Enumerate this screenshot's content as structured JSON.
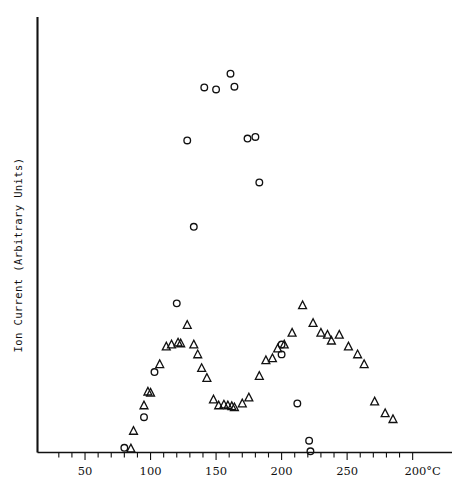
{
  "chart_data": {
    "type": "scatter",
    "title": "",
    "xlabel": "",
    "ylabel": "Ion Current (Arbitrary Units)",
    "x_unit": "°C",
    "xlim": [
      0,
      310
    ],
    "ylim": [
      0,
      100
    ],
    "grid": false,
    "legend": "none",
    "axis": {
      "x_major_ticks": [
        50,
        100,
        150,
        200,
        250,
        300
      ],
      "x_tick_labels": [
        "50",
        "100",
        "150",
        "200",
        "250",
        "200°C"
      ],
      "x_minor_tick_step": 10,
      "y_ticks": [],
      "y_tick_labels": []
    },
    "series": [
      {
        "name": "circles",
        "marker": "circle",
        "points": [
          [
            80,
            1.2
          ],
          [
            95,
            9.0
          ],
          [
            103,
            20.5
          ],
          [
            120,
            38.0
          ],
          [
            128,
            79.5
          ],
          [
            133,
            57.5
          ],
          [
            141,
            93.0
          ],
          [
            150,
            92.5
          ],
          [
            161,
            96.5
          ],
          [
            164,
            93.2
          ],
          [
            174,
            80.0
          ],
          [
            180,
            80.4
          ],
          [
            183,
            68.8
          ],
          [
            200,
            27.5
          ],
          [
            200,
            25.0
          ],
          [
            212,
            12.5
          ],
          [
            221,
            3.0
          ],
          [
            222,
            0.3
          ]
        ]
      },
      {
        "name": "triangles",
        "marker": "triangle",
        "points": [
          [
            85,
            1.0
          ],
          [
            87,
            5.5
          ],
          [
            95,
            12.0
          ],
          [
            98,
            15.5
          ],
          [
            100,
            15.2
          ],
          [
            107,
            22.5
          ],
          [
            112,
            27.0
          ],
          [
            116,
            27.5
          ],
          [
            121,
            28.0
          ],
          [
            123,
            27.8
          ],
          [
            128,
            32.5
          ],
          [
            133,
            27.5
          ],
          [
            136,
            25.0
          ],
          [
            139,
            21.5
          ],
          [
            143,
            19.0
          ],
          [
            148,
            13.5
          ],
          [
            152,
            12.0
          ],
          [
            156,
            12.2
          ],
          [
            159,
            12.0
          ],
          [
            162,
            11.8
          ],
          [
            164,
            11.5
          ],
          [
            170,
            12.5
          ],
          [
            175,
            14.0
          ],
          [
            183,
            19.5
          ],
          [
            188,
            23.5
          ],
          [
            193,
            24.0
          ],
          [
            197,
            26.5
          ],
          [
            202,
            27.5
          ],
          [
            208,
            30.5
          ],
          [
            216,
            37.5
          ],
          [
            224,
            33.0
          ],
          [
            230,
            30.5
          ],
          [
            235,
            30.0
          ],
          [
            238,
            28.5
          ],
          [
            244,
            30.0
          ],
          [
            251,
            27.0
          ],
          [
            258,
            25.0
          ],
          [
            263,
            22.5
          ],
          [
            271,
            13.0
          ],
          [
            279,
            10.0
          ],
          [
            285,
            8.5
          ]
        ]
      }
    ]
  }
}
